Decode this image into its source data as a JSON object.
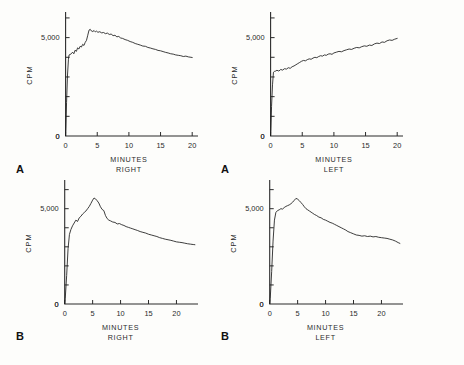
{
  "figure": {
    "background_color": "#fdfdfb",
    "ink_color": "#1b1b1b",
    "panel_letters": [
      {
        "label": "A",
        "x": 16,
        "y": 163
      },
      {
        "label": "A",
        "x": 221,
        "y": 163
      },
      {
        "label": "B",
        "x": 16,
        "y": 330
      },
      {
        "label": "B",
        "x": 221,
        "y": 330
      }
    ]
  },
  "chart_data": [
    {
      "type": "line",
      "panel": "A",
      "position": "top-left",
      "title": "",
      "xlabel": "MINUTES",
      "xlabel2": "RIGHT",
      "ylabel": "CPM",
      "xlim": [
        -1.2,
        20.6
      ],
      "ylim": [
        0,
        6200
      ],
      "xticks": [
        0,
        5,
        10,
        15,
        20
      ],
      "xticklabels": [
        "0",
        "5",
        "10",
        "15",
        "20"
      ],
      "yticks": [
        0,
        1000,
        2000,
        3000,
        4000,
        5000,
        6000
      ],
      "yticklabels": [
        "0",
        "",
        "",
        "",
        "",
        "5,000",
        ""
      ],
      "grid": false,
      "legend": null,
      "x": [
        0.0,
        0.05,
        0.15,
        0.3,
        0.45,
        0.55,
        0.7,
        0.9,
        1.1,
        1.3,
        1.5,
        1.7,
        1.9,
        2.1,
        2.3,
        2.5,
        2.7,
        2.9,
        3.1,
        3.3,
        3.5,
        3.7,
        3.9,
        4.1,
        4.3,
        4.5,
        4.7,
        4.9,
        5.1,
        5.4,
        5.7,
        6.0,
        6.3,
        6.6,
        6.9,
        7.2,
        7.5,
        7.8,
        8.1,
        8.4,
        8.7,
        9.0,
        9.4,
        9.8,
        10.2,
        10.6,
        11.0,
        11.4,
        11.8,
        12.2,
        12.6,
        13.0,
        13.4,
        13.8,
        14.2,
        14.6,
        15.0,
        15.4,
        15.8,
        16.2,
        16.6,
        17.0,
        17.4,
        17.8,
        18.2,
        18.6,
        19.0,
        19.4,
        19.8,
        20.0
      ],
      "y": [
        0,
        400,
        1700,
        3100,
        3900,
        4120,
        4140,
        4180,
        4260,
        4180,
        4360,
        4300,
        4480,
        4420,
        4560,
        4520,
        4660,
        4600,
        4760,
        4860,
        5120,
        5380,
        5420,
        5330,
        5310,
        5360,
        5290,
        5330,
        5270,
        5300,
        5240,
        5260,
        5200,
        5230,
        5160,
        5180,
        5100,
        5120,
        5040,
        5060,
        4980,
        4960,
        4900,
        4860,
        4800,
        4760,
        4700,
        4660,
        4620,
        4570,
        4560,
        4500,
        4470,
        4430,
        4400,
        4350,
        4330,
        4290,
        4250,
        4220,
        4180,
        4160,
        4120,
        4100,
        4080,
        4040,
        4060,
        4020,
        4000,
        3990
      ]
    },
    {
      "type": "line",
      "panel": "A",
      "position": "top-right",
      "title": "",
      "xlabel": "MINUTES",
      "xlabel2": "LEFT",
      "ylabel": "CPM",
      "xlim": [
        -1.2,
        20.6
      ],
      "ylim": [
        0,
        6200
      ],
      "xticks": [
        0,
        5,
        10,
        15,
        20
      ],
      "xticklabels": [
        "0",
        "5",
        "10",
        "15",
        "20"
      ],
      "yticks": [
        0,
        1000,
        2000,
        3000,
        4000,
        5000,
        6000
      ],
      "yticklabels": [
        "0",
        "",
        "",
        "",
        "",
        "5,000",
        ""
      ],
      "grid": false,
      "legend": null,
      "x": [
        0.0,
        0.05,
        0.15,
        0.3,
        0.45,
        0.6,
        0.8,
        1.0,
        1.3,
        1.6,
        1.9,
        2.2,
        2.5,
        2.8,
        3.1,
        3.4,
        3.7,
        4.0,
        4.3,
        4.6,
        4.9,
        5.2,
        5.5,
        5.8,
        6.1,
        6.4,
        6.7,
        7.0,
        7.3,
        7.6,
        7.9,
        8.2,
        8.5,
        8.8,
        9.1,
        9.4,
        9.7,
        10.0,
        10.4,
        10.8,
        11.2,
        11.6,
        12.0,
        12.4,
        12.8,
        13.2,
        13.6,
        14.0,
        14.4,
        14.8,
        15.2,
        15.6,
        16.0,
        16.4,
        16.8,
        17.2,
        17.6,
        18.0,
        18.4,
        18.8,
        19.2,
        19.6,
        20.0
      ],
      "y": [
        0,
        360,
        1500,
        2600,
        3240,
        3280,
        3300,
        3340,
        3300,
        3380,
        3350,
        3420,
        3400,
        3470,
        3440,
        3520,
        3560,
        3620,
        3680,
        3740,
        3800,
        3840,
        3820,
        3880,
        3920,
        3900,
        3960,
        4000,
        3980,
        4040,
        4080,
        4060,
        4120,
        4100,
        4160,
        4180,
        4150,
        4220,
        4260,
        4300,
        4280,
        4340,
        4380,
        4420,
        4400,
        4460,
        4500,
        4480,
        4540,
        4580,
        4560,
        4620,
        4600,
        4680,
        4720,
        4700,
        4780,
        4760,
        4840,
        4880,
        4860,
        4920,
        4960
      ]
    },
    {
      "type": "line",
      "panel": "B",
      "position": "bottom-left",
      "title": "",
      "xlabel": "MINUTES",
      "xlabel2": "RIGHT",
      "ylabel": "CPM",
      "xlim": [
        -1.2,
        23.5
      ],
      "ylim": [
        0,
        6400
      ],
      "xticks": [
        0,
        5,
        10,
        15,
        20
      ],
      "xticklabels": [
        "0",
        "5",
        "10",
        "15",
        "20"
      ],
      "yticks": [
        0,
        1000,
        2000,
        3000,
        4000,
        5000,
        6000
      ],
      "yticklabels": [
        "0",
        "",
        "",
        "",
        "",
        "5,000",
        ""
      ],
      "grid": false,
      "legend": null,
      "x": [
        0.0,
        0.1,
        0.35,
        0.6,
        0.85,
        1.1,
        1.4,
        1.7,
        2.0,
        2.3,
        2.6,
        2.9,
        3.2,
        3.5,
        3.8,
        4.1,
        4.4,
        4.7,
        5.0,
        5.25,
        5.5,
        5.8,
        6.1,
        6.4,
        6.7,
        7.0,
        7.3,
        7.6,
        7.9,
        8.2,
        8.6,
        9.0,
        9.4,
        9.8,
        10.2,
        10.6,
        11.0,
        11.4,
        11.8,
        12.2,
        12.6,
        13.0,
        13.5,
        14.0,
        14.5,
        15.0,
        15.5,
        16.0,
        16.5,
        17.0,
        17.5,
        18.0,
        18.5,
        19.0,
        19.5,
        20.0,
        20.5,
        21.0,
        21.5,
        22.0,
        22.5,
        23.0,
        23.3
      ],
      "y": [
        0,
        300,
        1500,
        2900,
        3650,
        3900,
        4100,
        4250,
        4400,
        4330,
        4520,
        4600,
        4720,
        4800,
        4880,
        5000,
        5120,
        5280,
        5450,
        5560,
        5520,
        5420,
        5300,
        5100,
        4960,
        4900,
        4640,
        4480,
        4400,
        4360,
        4300,
        4280,
        4200,
        4220,
        4160,
        4120,
        4060,
        4020,
        3980,
        3940,
        3900,
        3860,
        3800,
        3760,
        3720,
        3660,
        3620,
        3580,
        3540,
        3480,
        3440,
        3400,
        3370,
        3340,
        3300,
        3260,
        3240,
        3220,
        3190,
        3160,
        3140,
        3120,
        3110
      ]
    },
    {
      "type": "line",
      "panel": "B",
      "position": "bottom-right",
      "title": "",
      "xlabel": "MINUTES",
      "xlabel2": "LEFT",
      "ylabel": "CPM",
      "xlim": [
        -1.2,
        23.5
      ],
      "ylim": [
        0,
        6400
      ],
      "xticks": [
        0,
        5,
        10,
        15,
        20
      ],
      "xticklabels": [
        "0",
        "5",
        "10",
        "15",
        "20"
      ],
      "yticks": [
        0,
        1000,
        2000,
        3000,
        4000,
        5000,
        6000
      ],
      "yticklabels": [
        "0",
        "",
        "",
        "",
        "",
        "5,000",
        ""
      ],
      "grid": false,
      "legend": null,
      "x": [
        0.0,
        0.1,
        0.35,
        0.6,
        0.85,
        1.1,
        1.4,
        1.7,
        2.0,
        2.3,
        2.6,
        2.9,
        3.2,
        3.5,
        3.8,
        4.1,
        4.4,
        4.7,
        5.0,
        5.3,
        5.6,
        5.9,
        6.2,
        6.5,
        6.8,
        7.1,
        7.4,
        7.7,
        8.0,
        8.4,
        8.8,
        9.2,
        9.6,
        10.0,
        10.4,
        10.8,
        11.2,
        11.6,
        12.0,
        12.4,
        12.8,
        13.2,
        13.6,
        14.0,
        14.5,
        15.0,
        15.5,
        16.0,
        16.5,
        17.0,
        17.5,
        18.0,
        18.5,
        19.0,
        19.5,
        20.0,
        20.5,
        21.0,
        21.5,
        22.0,
        22.5,
        23.0,
        23.3
      ],
      "y": [
        0,
        300,
        1700,
        3300,
        4400,
        4800,
        4900,
        4940,
        5000,
        4980,
        5060,
        5120,
        5160,
        5200,
        5260,
        5340,
        5440,
        5540,
        5500,
        5420,
        5320,
        5220,
        5100,
        5000,
        4940,
        4880,
        4820,
        4760,
        4700,
        4640,
        4560,
        4520,
        4440,
        4400,
        4340,
        4280,
        4240,
        4180,
        4120,
        4060,
        4000,
        3940,
        3880,
        3800,
        3740,
        3680,
        3620,
        3600,
        3560,
        3580,
        3540,
        3560,
        3520,
        3540,
        3500,
        3480,
        3460,
        3440,
        3400,
        3360,
        3300,
        3220,
        3180
      ]
    }
  ]
}
